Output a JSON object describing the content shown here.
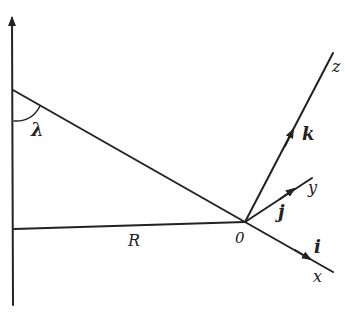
{
  "diagram": {
    "labels": {
      "angle": "λ",
      "radius": "R",
      "origin": "0",
      "axis_x": "x",
      "axis_y": "y",
      "axis_z": "z",
      "unit_i": "i",
      "unit_j": "j",
      "unit_k": "k"
    }
  }
}
